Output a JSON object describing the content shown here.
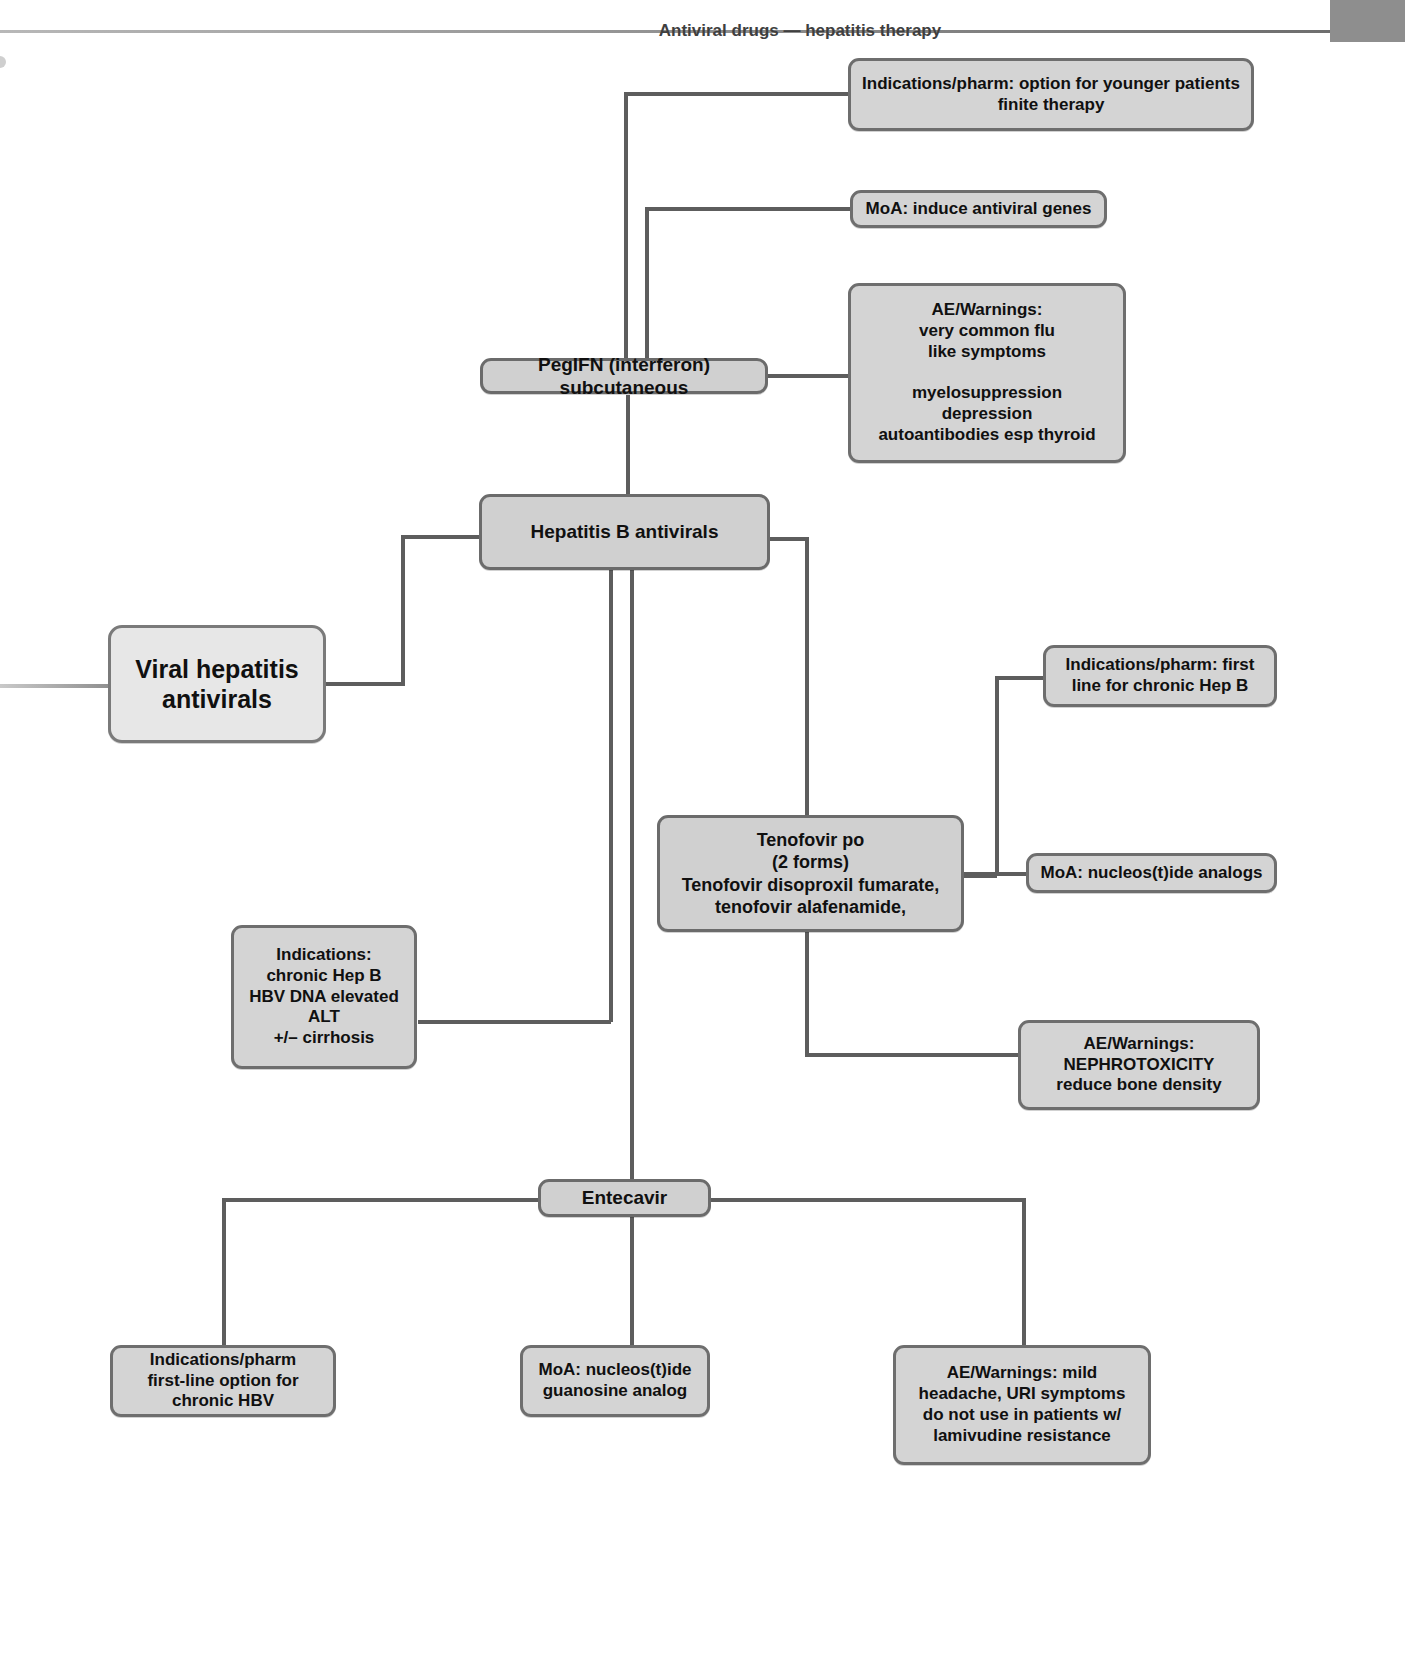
{
  "header": {
    "title": "Antiviral drugs — hepatitis therapy",
    "tab_label": ""
  },
  "diagram": {
    "type": "mind-map",
    "root": {
      "id": "root",
      "label": "Viral hepatitis\nantivirals"
    },
    "nodes": [
      {
        "id": "hepb-antivirals",
        "label": "Hepatitis B antivirals",
        "role": "branch"
      },
      {
        "id": "pegifn",
        "label": "PegIFN (interferon) subcutaneous",
        "role": "branch"
      },
      {
        "id": "pegifn-indications",
        "label": "Indications/pharm: option for younger patients\nfinite therapy",
        "role": "leaf"
      },
      {
        "id": "pegifn-moa",
        "label": "MoA: induce antiviral genes",
        "role": "leaf"
      },
      {
        "id": "pegifn-ae",
        "label": "AE/Warnings:\nvery common flu\nlike symptoms\n\nmyelosuppression\ndepression\nautoantibodies esp thyroid",
        "role": "leaf"
      },
      {
        "id": "hepb-indications",
        "label": "Indications:\nchronic Hep B\nHBV DNA  elevated\nALT\n+/– cirrhosis",
        "role": "leaf"
      },
      {
        "id": "tenofovir",
        "label": "Tenofovir po\n(2 forms)\nTenofovir disoproxil fumarate,\ntenofovir alafenamide,",
        "role": "branch"
      },
      {
        "id": "tenofovir-indications",
        "label": "Indications/pharm: first\nline for chronic Hep B",
        "role": "leaf"
      },
      {
        "id": "tenofovir-moa",
        "label": "MoA: nucleos(t)ide analogs",
        "role": "leaf"
      },
      {
        "id": "tenofovir-ae",
        "label": "AE/Warnings:\nNEPHROTOXICITY\nreduce bone density",
        "role": "leaf"
      },
      {
        "id": "entecavir",
        "label": "Entecavir",
        "role": "branch"
      },
      {
        "id": "entecavir-indications",
        "label": "Indications/pharm\nfirst-line option for chronic HBV",
        "role": "leaf"
      },
      {
        "id": "entecavir-moa",
        "label": "MoA: nucleos(t)ide\nguanosine analog",
        "role": "leaf"
      },
      {
        "id": "entecavir-ae",
        "label": "AE/Warnings: mild\nheadache, URI symptoms\ndo not use in patients w/\nlamivudine resistance",
        "role": "leaf"
      }
    ],
    "colors": {
      "node_fill": "#d4d4d4",
      "root_fill": "#e7e7e7",
      "node_border": "#6e6e6e",
      "connector": "#5d5d5d",
      "header_tab": "#8e8e8e"
    }
  }
}
